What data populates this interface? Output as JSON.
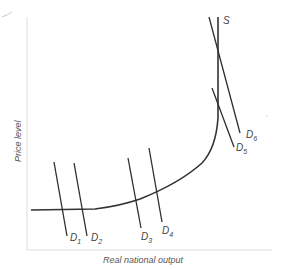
{
  "diagram": {
    "type": "aggregate supply / aggregate demand",
    "x_axis_label": "Real national output",
    "y_axis_label": "Price level",
    "supply_curve": {
      "label": "S"
    },
    "demand_curves": [
      {
        "id": "D1",
        "letter": "D",
        "subscript": "1"
      },
      {
        "id": "D2",
        "letter": "D",
        "subscript": "2"
      },
      {
        "id": "D3",
        "letter": "D",
        "subscript": "3"
      },
      {
        "id": "D4",
        "letter": "D",
        "subscript": "4"
      },
      {
        "id": "D5",
        "letter": "D",
        "subscript": "5"
      },
      {
        "id": "D6",
        "letter": "D",
        "subscript": "6"
      }
    ]
  }
}
